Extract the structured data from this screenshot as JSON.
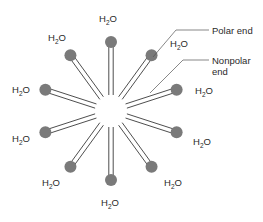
{
  "diagram": {
    "type": "micelle",
    "center": [
      111,
      111
    ],
    "head_radius": 6,
    "head_distance": 69,
    "tail_inner_radius": 16,
    "molecule_count": 10,
    "angles_deg": [
      -90,
      -54,
      -18,
      18,
      54,
      90,
      126,
      162,
      198,
      234
    ],
    "colors": {
      "head": "#7a7a7a",
      "tail": "#3a3a3a",
      "text": "#2a2a2a",
      "background": "#ffffff"
    },
    "water_labels": [
      {
        "text": "H",
        "sub": "2",
        "tail": "O",
        "x": 99,
        "y": 22
      },
      {
        "text": "H",
        "sub": "2",
        "tail": "O",
        "x": 48,
        "y": 41
      },
      {
        "text": "H",
        "sub": "2",
        "tail": "O",
        "x": 170,
        "y": 47
      },
      {
        "text": "H",
        "sub": "2",
        "tail": "O",
        "x": 12,
        "y": 93
      },
      {
        "text": "H",
        "sub": "2",
        "tail": "O",
        "x": 195,
        "y": 94
      },
      {
        "text": "H",
        "sub": "2",
        "tail": "O",
        "x": 12,
        "y": 142
      },
      {
        "text": "H",
        "sub": "2",
        "tail": "O",
        "x": 193,
        "y": 145
      },
      {
        "text": "H",
        "sub": "2",
        "tail": "O",
        "x": 42,
        "y": 186
      },
      {
        "text": "H",
        "sub": "2",
        "tail": "O",
        "x": 164,
        "y": 186
      },
      {
        "text": "H",
        "sub": "2",
        "tail": "O",
        "x": 101,
        "y": 206
      }
    ],
    "callouts": {
      "polar": {
        "label": "Polar end",
        "line": [
          [
            153,
            57
          ],
          [
            176,
            30
          ],
          [
            209,
            30
          ]
        ],
        "text_x": 212,
        "text_y": 34
      },
      "nonpolar": {
        "label_line1": "Nonpolar",
        "label_line2": "end",
        "line": [
          [
            150,
            93
          ],
          [
            183,
            60
          ],
          [
            209,
            60
          ]
        ],
        "text_x": 212,
        "text_y": 64,
        "text_y2": 75
      }
    }
  }
}
